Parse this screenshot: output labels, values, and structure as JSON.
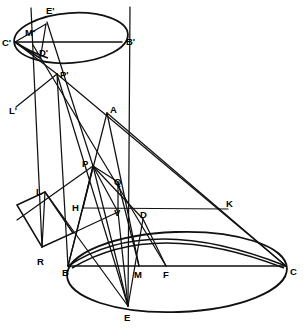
{
  "figure": {
    "domain": "geometric-construction-diagram",
    "background_color": "#ffffff",
    "ink_color": "#111111",
    "caption": "Fig. 4",
    "caption_visible": false
  },
  "labels": [
    {
      "id": "E-prime",
      "text": "E'",
      "x": 46,
      "y": 14
    },
    {
      "id": "C-prime",
      "text": "C'",
      "x": 2,
      "y": 46
    },
    {
      "id": "M-prime",
      "text": "M'",
      "x": 25,
      "y": 36
    },
    {
      "id": "D-prime",
      "text": "D'",
      "x": 39,
      "y": 56
    },
    {
      "id": "B-prime",
      "text": "B'",
      "x": 126,
      "y": 45
    },
    {
      "id": "P-prime",
      "text": "P'",
      "x": 60,
      "y": 78
    },
    {
      "id": "L-prime",
      "text": "L'",
      "x": 9,
      "y": 114
    },
    {
      "id": "A",
      "text": "A",
      "x": 110,
      "y": 113
    },
    {
      "id": "P",
      "text": "P",
      "x": 82,
      "y": 167
    },
    {
      "id": "Q",
      "text": "Q",
      "x": 114,
      "y": 185
    },
    {
      "id": "L",
      "text": "L",
      "x": 36,
      "y": 195
    },
    {
      "id": "H",
      "text": "H",
      "x": 72,
      "y": 211
    },
    {
      "id": "V",
      "text": "V",
      "x": 114,
      "y": 216
    },
    {
      "id": "D",
      "text": "D",
      "x": 140,
      "y": 218
    },
    {
      "id": "K",
      "text": "K",
      "x": 226,
      "y": 207
    },
    {
      "id": "R",
      "text": "R",
      "x": 37,
      "y": 265
    },
    {
      "id": "B",
      "text": "B",
      "x": 62,
      "y": 276
    },
    {
      "id": "M",
      "text": "M",
      "x": 134,
      "y": 278
    },
    {
      "id": "F",
      "text": "F",
      "x": 163,
      "y": 278
    },
    {
      "id": "C",
      "text": "C",
      "x": 290,
      "y": 275
    },
    {
      "id": "E",
      "text": "E",
      "x": 124,
      "y": 321
    }
  ],
  "points": {
    "Eprime": [
      46,
      24
    ],
    "Cprime": [
      15,
      42
    ],
    "Mprime": [
      33,
      45
    ],
    "Dprime": [
      45,
      53
    ],
    "Bprime": [
      122,
      42
    ],
    "Pprime": [
      57,
      74
    ],
    "Lprime": [
      16,
      107
    ],
    "A": [
      107,
      113
    ],
    "P": [
      93,
      166
    ],
    "Q": [
      118,
      182
    ],
    "L": [
      45,
      192
    ],
    "H": [
      83,
      208
    ],
    "V": [
      118,
      212
    ],
    "D": [
      143,
      219
    ],
    "K": [
      228,
      209
    ],
    "R": [
      42,
      247
    ],
    "B": [
      68,
      266
    ],
    "M": [
      139,
      266
    ],
    "F": [
      166,
      266
    ],
    "C": [
      286,
      266
    ],
    "E": [
      128,
      306
    ]
  },
  "shapes": {
    "upper_ellipse": {
      "cx": 71,
      "cy": 38,
      "rx": 57,
      "ry": 25,
      "rotation": -4
    },
    "lower_ellipse": {
      "cx": 177,
      "cy": 272,
      "rx": 110,
      "ry": 40,
      "rotation": -2
    },
    "parallelogram": [
      [
        17,
        205
      ],
      [
        45,
        192
      ],
      [
        73,
        233
      ],
      [
        42,
        247
      ]
    ]
  },
  "accessibility": {
    "alt": "Technical line drawing of two ellipses connected by a cone of projection lines with labelled intersection points"
  }
}
